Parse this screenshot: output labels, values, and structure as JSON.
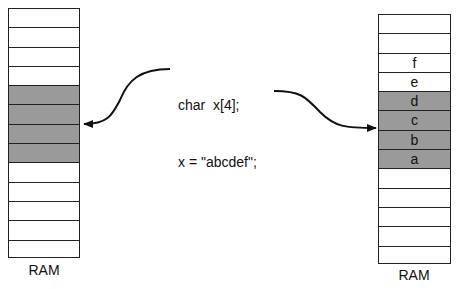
{
  "code": {
    "line1": "char  x[4];",
    "line2": "x = \"abcdef\";"
  },
  "left_ram": {
    "label": "RAM",
    "cells": [
      {
        "text": "",
        "gray": false
      },
      {
        "text": "",
        "gray": false
      },
      {
        "text": "",
        "gray": false
      },
      {
        "text": "",
        "gray": false
      },
      {
        "text": "",
        "gray": true
      },
      {
        "text": "",
        "gray": true
      },
      {
        "text": "",
        "gray": true
      },
      {
        "text": "",
        "gray": true
      },
      {
        "text": "",
        "gray": false
      },
      {
        "text": "",
        "gray": false
      },
      {
        "text": "",
        "gray": false
      },
      {
        "text": "",
        "gray": false
      },
      {
        "text": "",
        "gray": false
      }
    ]
  },
  "right_ram": {
    "label": "RAM",
    "cells": [
      {
        "text": "",
        "gray": false
      },
      {
        "text": "",
        "gray": false
      },
      {
        "text": "f",
        "gray": false
      },
      {
        "text": "e",
        "gray": false
      },
      {
        "text": "d",
        "gray": true
      },
      {
        "text": "c",
        "gray": true
      },
      {
        "text": "b",
        "gray": true
      },
      {
        "text": "a",
        "gray": true
      },
      {
        "text": "",
        "gray": false
      },
      {
        "text": "",
        "gray": false
      },
      {
        "text": "",
        "gray": false
      },
      {
        "text": "",
        "gray": false
      },
      {
        "text": "",
        "gray": false
      }
    ]
  },
  "colors": {
    "gray_cell": "#9a9a9a",
    "line": "#222222"
  }
}
